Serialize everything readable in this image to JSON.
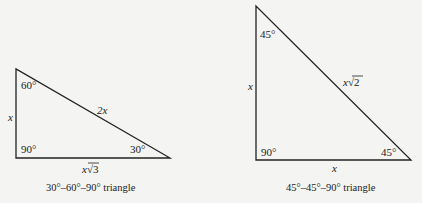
{
  "triangles": [
    {
      "caption": "30°–60°–90° triangle",
      "angles": {
        "top": "60°",
        "right_angle": "90°",
        "bottom_right": "30°"
      },
      "sides": {
        "vertical": "x",
        "hypotenuse": "2x",
        "base": "x√3"
      },
      "base_var": "x",
      "base_root": "3"
    },
    {
      "caption": "45°–45°–90° triangle",
      "angles": {
        "top": "45°",
        "right_angle": "90°",
        "bottom_right": "45°"
      },
      "sides": {
        "vertical": "x",
        "hypotenuse": "x√2",
        "base": "x"
      },
      "hyp_var": "x",
      "hyp_root": "2"
    }
  ]
}
